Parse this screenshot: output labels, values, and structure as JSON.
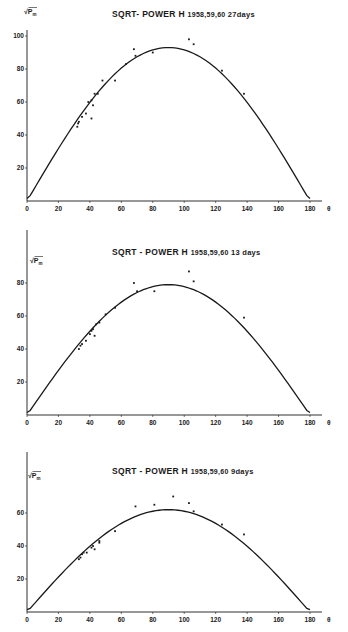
{
  "colors": {
    "ink": "#1a1a1a",
    "background": "#ffffff"
  },
  "chart_data": [
    {
      "type": "scatter",
      "title": "SQRT- POWER H",
      "years": "1958,59,60",
      "period": "27days",
      "xlabel": "θ",
      "ylabel": "√Pₘ",
      "xlim": [
        0,
        180
      ],
      "ylim": [
        0,
        100
      ],
      "xticks": [
        "0",
        "20",
        "40",
        "60",
        "80",
        "100",
        "120",
        "140",
        "160",
        "180"
      ],
      "yticks": [
        "20",
        "40",
        "60",
        "80",
        "100"
      ],
      "grid": false,
      "curve": {
        "type": "sine",
        "amplitude": 93,
        "x_range": [
          0,
          180
        ]
      },
      "points": [
        [
          32,
          45
        ],
        [
          32.5,
          47
        ],
        [
          33,
          48
        ],
        [
          35,
          51
        ],
        [
          37.5,
          53
        ],
        [
          39,
          60
        ],
        [
          41,
          61
        ],
        [
          41,
          50
        ],
        [
          42,
          58
        ],
        [
          43,
          65
        ],
        [
          45,
          65
        ],
        [
          48,
          73
        ],
        [
          56,
          73
        ],
        [
          63,
          83
        ],
        [
          68,
          92
        ],
        [
          69,
          88
        ],
        [
          80,
          90
        ],
        [
          103,
          98
        ],
        [
          106,
          95
        ],
        [
          124,
          79
        ],
        [
          138,
          65
        ]
      ]
    },
    {
      "type": "scatter",
      "title": "SQRT - POWER H",
      "years": "1958,59,60",
      "period": "13 days",
      "xlabel": "θ",
      "ylabel": "√Pₘ",
      "xlim": [
        0,
        180
      ],
      "ylim": [
        0,
        100
      ],
      "xticks": [
        "0",
        "20",
        "40",
        "60",
        "80",
        "100",
        "120",
        "140",
        "160",
        "180"
      ],
      "yticks": [
        "20",
        "40",
        "60",
        "80"
      ],
      "grid": false,
      "curve": {
        "type": "sine",
        "amplitude": 79,
        "x_range": [
          0,
          180
        ]
      },
      "points": [
        [
          33,
          40
        ],
        [
          34,
          42
        ],
        [
          35,
          43
        ],
        [
          37.5,
          45
        ],
        [
          40,
          49
        ],
        [
          41,
          51
        ],
        [
          42,
          52
        ],
        [
          43,
          48
        ],
        [
          44,
          55
        ],
        [
          46,
          56
        ],
        [
          50,
          61
        ],
        [
          56,
          65
        ],
        [
          68,
          80
        ],
        [
          70,
          75
        ],
        [
          81,
          75
        ],
        [
          103,
          87
        ],
        [
          106,
          81
        ],
        [
          138,
          59
        ]
      ]
    },
    {
      "type": "scatter",
      "title": "SQRT - POWER H",
      "years": "1958,59,60",
      "period": "9days",
      "xlabel": "θ",
      "ylabel": "√Pₘ",
      "xlim": [
        0,
        180
      ],
      "ylim": [
        0,
        100
      ],
      "xticks": [
        "0",
        "20",
        "40",
        "60",
        "80",
        "100",
        "120",
        "140",
        "160",
        "180"
      ],
      "yticks": [
        "20",
        "40",
        "60"
      ],
      "grid": false,
      "curve": {
        "type": "sine",
        "amplitude": 62,
        "x_range": [
          0,
          180
        ]
      },
      "points": [
        [
          33,
          32
        ],
        [
          34,
          33
        ],
        [
          35,
          35
        ],
        [
          36,
          36
        ],
        [
          38,
          36
        ],
        [
          41,
          39
        ],
        [
          42,
          40
        ],
        [
          43,
          38
        ],
        [
          46,
          43
        ],
        [
          46,
          42
        ],
        [
          56,
          49
        ],
        [
          69,
          64
        ],
        [
          81,
          65
        ],
        [
          93,
          70
        ],
        [
          103,
          66
        ],
        [
          106,
          61
        ],
        [
          124,
          53
        ],
        [
          138,
          47
        ]
      ]
    }
  ],
  "panels": [
    {
      "title": "SQRT- POWER H",
      "years": "1958,59,60",
      "period": "27days",
      "ylabel": "√P",
      "ysub": "m",
      "xaxis_symbol": "θ"
    },
    {
      "title": "SQRT - POWER H",
      "years": "1958,59,60",
      "period": "13 days",
      "ylabel": "√P",
      "ysub": "m",
      "xaxis_symbol": "θ"
    },
    {
      "title": "SQRT - POWER H",
      "years": "1958,59,60",
      "period": "9days",
      "ylabel": "√P",
      "ysub": "m",
      "xaxis_symbol": "θ"
    }
  ]
}
